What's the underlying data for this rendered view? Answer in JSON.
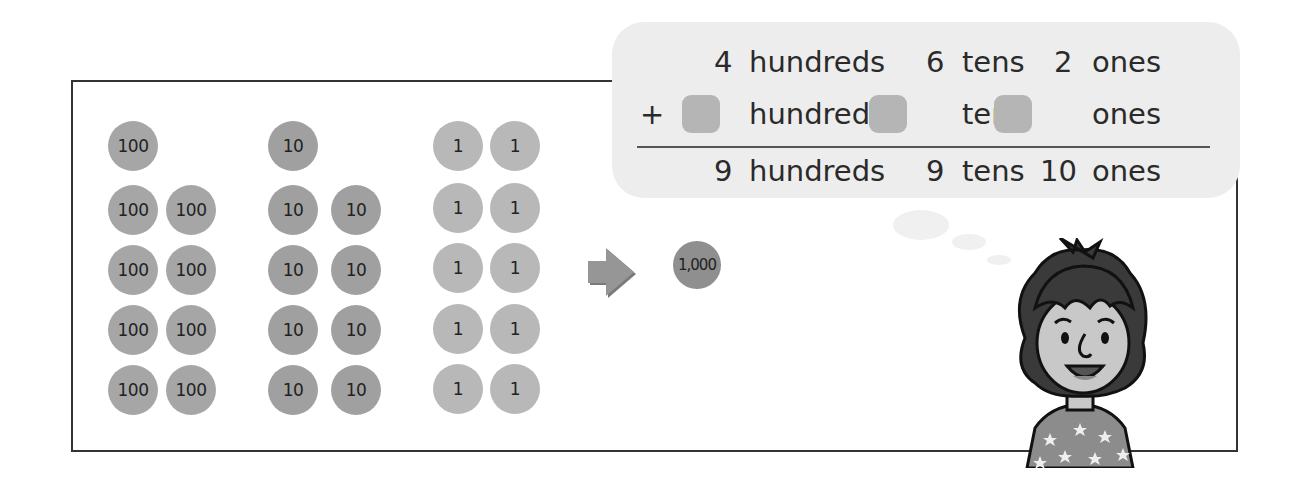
{
  "coins": {
    "hundreds": {
      "label": "100",
      "count": 9
    },
    "tens": {
      "label": "10",
      "count": 9
    },
    "ones": {
      "label": "1",
      "count": 10
    },
    "thousand": {
      "label": "1,000"
    }
  },
  "equation": {
    "row1": {
      "hundreds_value": "4",
      "hundreds_label": "hundreds",
      "tens_value": "6",
      "tens_label": "tens",
      "ones_value": "2",
      "ones_label": "ones"
    },
    "row2": {
      "operator": "+",
      "hundreds_label": "hundreds",
      "tens_label": "tens",
      "ones_label": "ones"
    },
    "row3": {
      "hundreds_value": "9",
      "hundreds_label": "hundreds",
      "tens_value": "9",
      "tens_label": "tens",
      "ones_value": "10",
      "ones_label": "ones"
    }
  },
  "colors": {
    "bubble": "#ededed",
    "coin_100": "#a6a6a6",
    "coin_10": "#a0a0a0",
    "coin_1": "#b8b8b8",
    "coin_1000": "#8f8f8f",
    "answer_box": "#b5b5b5"
  }
}
